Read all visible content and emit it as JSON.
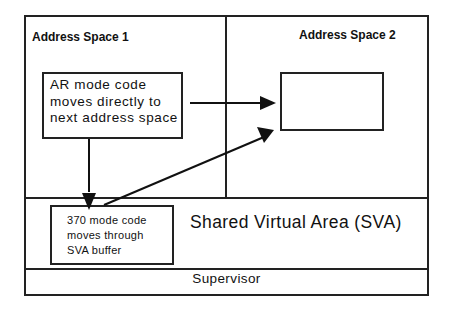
{
  "diagram": {
    "regions": {
      "address_space_1": {
        "title": "Address Space 1"
      },
      "address_space_2": {
        "title": "Address Space 2"
      },
      "sva": {
        "label": "Shared Virtual Area (SVA)"
      },
      "supervisor": {
        "label": "Supervisor"
      }
    },
    "boxes": {
      "ar_mode": {
        "lines": [
          "AR mode code",
          "moves directly to",
          "next address space"
        ]
      },
      "mode_370": {
        "lines": [
          "370 mode code",
          "moves through",
          "SVA buffer"
        ]
      },
      "target": {
        "label": ""
      }
    },
    "arrows": [
      {
        "from": "ar_mode",
        "to": "target",
        "description": "direct move"
      },
      {
        "from": "ar_mode",
        "to": "mode_370",
        "description": "down to SVA buffer"
      },
      {
        "from": "mode_370",
        "to": "target",
        "description": "via SVA buffer"
      }
    ],
    "colors": {
      "line": "#222222",
      "background": "#ffffff"
    }
  }
}
